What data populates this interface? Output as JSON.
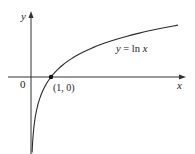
{
  "chart_data": {
    "type": "line",
    "title": "",
    "xlabel": "x",
    "ylabel": "y",
    "series": [
      {
        "name": "y = ln x",
        "function": "ln(x)",
        "x": [
          0.05,
          0.1,
          0.2,
          0.3,
          0.5,
          0.75,
          1,
          1.5,
          2,
          3,
          4,
          5,
          6,
          7.35
        ],
        "values": [
          -3.0,
          -2.3,
          -1.61,
          -1.2,
          -0.69,
          -0.29,
          0,
          0.41,
          0.69,
          1.1,
          1.39,
          1.61,
          1.79,
          1.99
        ]
      }
    ],
    "annotations": [
      {
        "text": "(1, 0)",
        "x": 1,
        "y": 0,
        "marker": "dot"
      },
      {
        "text": "y = ln x",
        "label_for": "curve"
      }
    ],
    "origin_label": "0",
    "xlim": [
      -1.15,
      7.7
    ],
    "ylim": [
      -3.0,
      2.5
    ],
    "grid": false,
    "legend": "none",
    "tick_labels": []
  },
  "labels": {
    "y_axis": "y",
    "x_axis": "x",
    "origin": "0",
    "point": "(1, 0)",
    "curve": "y = ln x"
  },
  "colors": {
    "axis": "#333333",
    "curve": "#2a2a2a",
    "text": "#222222"
  }
}
